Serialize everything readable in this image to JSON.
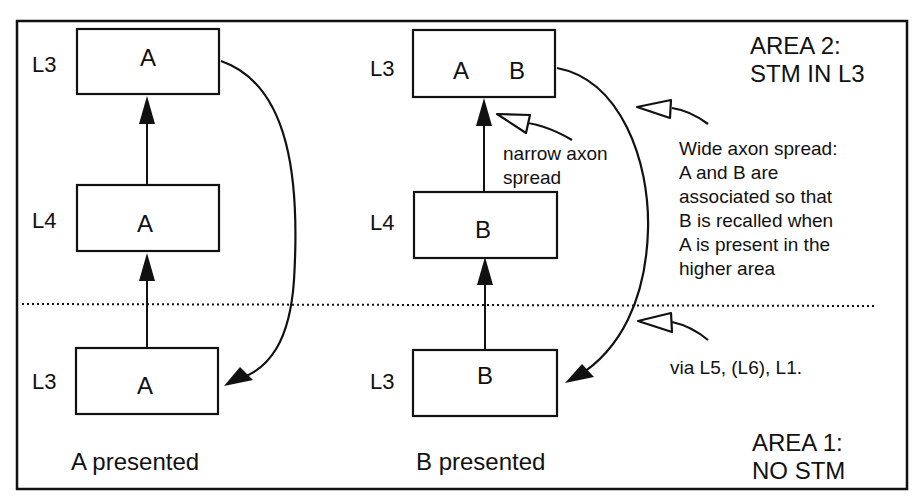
{
  "area2": {
    "line1": "AREA 2:",
    "line2": "STM IN L3"
  },
  "area1": {
    "line1": "AREA 1:",
    "line2": "NO STM"
  },
  "columns": [
    {
      "caption": "A presented",
      "boxes": [
        {
          "layer": "L3",
          "content": "A"
        },
        {
          "layer": "L4",
          "content": "A"
        },
        {
          "layer": "L3",
          "content": "A"
        }
      ]
    },
    {
      "caption": "B presented",
      "boxes": [
        {
          "layer": "L3",
          "content_a": "A",
          "content_b": "B"
        },
        {
          "layer": "L4",
          "content": "B"
        },
        {
          "layer": "L3",
          "content": "B"
        }
      ]
    }
  ],
  "annotations": {
    "narrow": {
      "line1": "narrow axon",
      "line2": "spread"
    },
    "wide": {
      "lines": [
        "Wide axon spread:",
        "A and B are",
        "associated so that",
        "B is recalled when",
        "A is present in the",
        "higher area"
      ]
    },
    "via": "via L5, (L6), L1."
  },
  "colors": {
    "ink": "#111111",
    "background": "#ffffff"
  }
}
